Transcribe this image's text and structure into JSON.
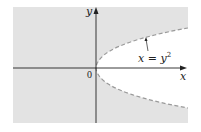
{
  "figure": {
    "x_axis_label": "x",
    "y_axis_label": "y",
    "origin_label": "0",
    "curve_label_lhs": "x = y",
    "curve_label_exp": "2",
    "curve_equation": "x = y^2",
    "curve_style": "dashed",
    "shaded_region": "outside the parabola (x < y^2)",
    "colors": {
      "shade": "#e3e3e3",
      "axis": "#222222",
      "curve": "#9a9a9a",
      "background": "#ffffff"
    }
  }
}
